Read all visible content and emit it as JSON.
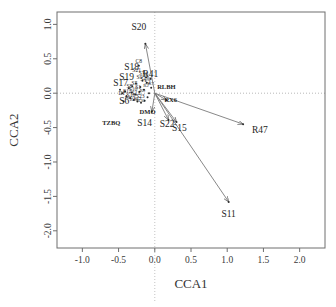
{
  "chart_data": {
    "type": "scatter",
    "title": "",
    "xlabel": "CCA1",
    "ylabel": "CCA2",
    "xlim": [
      -1.35,
      2.35
    ],
    "ylim": [
      -2.25,
      1.18
    ],
    "xticks": [
      -1.0,
      -0.5,
      0.0,
      0.5,
      1.0,
      1.5,
      2.0
    ],
    "xticklabels": [
      "-1.0",
      "-0.5",
      "0.0",
      "0.5",
      "1.0",
      "1.5",
      "2.0"
    ],
    "yticks": [
      1.0,
      0.5,
      0.0,
      -0.5,
      -1.0,
      -1.5,
      -2.0
    ],
    "yticklabels": [
      "1.0",
      "0.5",
      "0.0",
      "-0.5",
      "-1.0",
      "-1.5",
      "-2.0"
    ],
    "grid": false,
    "zero_lines": true,
    "legend": "none",
    "arrows": [
      {
        "label": "S20",
        "x": -0.13,
        "y": 0.72,
        "label_x": -0.22,
        "label_y": 0.92,
        "size": "big"
      },
      {
        "label": "R47",
        "x": 1.22,
        "y": -0.45,
        "label_x": 1.45,
        "label_y": -0.58,
        "size": "big"
      },
      {
        "label": "S11",
        "x": 1.02,
        "y": -1.58,
        "label_x": 1.02,
        "label_y": -1.8,
        "size": "big"
      },
      {
        "label": "S15",
        "x": 0.3,
        "y": -0.42,
        "label_x": 0.34,
        "label_y": -0.55,
        "size": "big"
      },
      {
        "label": "S22",
        "x": 0.19,
        "y": -0.39,
        "label_x": 0.17,
        "label_y": -0.49,
        "size": "big"
      },
      {
        "label": "RX6",
        "x": 0.16,
        "y": -0.1,
        "label_x": 0.22,
        "label_y": -0.13,
        "size": "bold"
      },
      {
        "label": "DMO",
        "x": -0.04,
        "y": -0.27,
        "label_x": -0.1,
        "label_y": -0.3,
        "size": "bold"
      }
    ],
    "points": [
      {
        "label": "RLBH",
        "x": 0.16,
        "y": 0.06,
        "size": "bold"
      },
      {
        "label": "TZBQ",
        "x": -0.6,
        "y": -0.46,
        "size": "bold"
      },
      {
        "label": "S14",
        "x": -0.14,
        "y": -0.47,
        "size": "big"
      },
      {
        "label": "S18",
        "x": -0.32,
        "y": 0.33,
        "size": "big"
      },
      {
        "label": "S19",
        "x": -0.39,
        "y": 0.19,
        "size": "big"
      },
      {
        "label": "S17",
        "x": -0.47,
        "y": 0.1,
        "size": "big"
      },
      {
        "label": "S6",
        "x": -0.42,
        "y": -0.15,
        "size": "big"
      },
      {
        "label": "C8",
        "x": -0.22,
        "y": 0.44,
        "size": "tiny"
      },
      {
        "label": "R41",
        "x": -0.06,
        "y": 0.23,
        "size": "big"
      },
      {
        "label": "S21",
        "x": -0.25,
        "y": 0.31,
        "size": "tiny"
      },
      {
        "label": "S7",
        "x": -0.18,
        "y": 0.27,
        "size": "tiny"
      },
      {
        "label": "S3",
        "x": -0.13,
        "y": 0.25,
        "size": "tiny"
      },
      {
        "label": "S9",
        "x": -0.21,
        "y": 0.2,
        "size": "tiny"
      },
      {
        "label": "S4",
        "x": -0.16,
        "y": 0.17,
        "size": "tiny"
      },
      {
        "label": "S2",
        "x": -0.1,
        "y": 0.14,
        "size": "tiny"
      },
      {
        "label": "S5",
        "x": -0.28,
        "y": 0.12,
        "size": "tiny"
      },
      {
        "label": "S8",
        "x": -0.35,
        "y": 0.08,
        "size": "tiny"
      },
      {
        "label": "S1",
        "x": -0.23,
        "y": 0.06,
        "size": "tiny"
      },
      {
        "label": "S10",
        "x": -0.3,
        "y": 0.03,
        "size": "tiny"
      },
      {
        "label": "S12",
        "x": -0.38,
        "y": 0.0,
        "size": "tiny"
      },
      {
        "label": "S13",
        "x": -0.26,
        "y": -0.02,
        "size": "tiny"
      },
      {
        "label": "S16",
        "x": -0.33,
        "y": -0.05,
        "size": "tiny"
      },
      {
        "label": "S23",
        "x": -0.2,
        "y": -0.07,
        "size": "tiny"
      },
      {
        "label": "DF",
        "x": -0.45,
        "y": -0.03,
        "size": "tiny"
      },
      {
        "label": "R2",
        "x": -0.12,
        "y": 0.09,
        "size": "micro"
      },
      {
        "label": "R5",
        "x": -0.08,
        "y": 0.19,
        "size": "micro"
      },
      {
        "label": "R7",
        "x": -0.05,
        "y": 0.12,
        "size": "micro"
      },
      {
        "label": "R9",
        "x": -0.17,
        "y": 0.02,
        "size": "micro"
      },
      {
        "label": "R12",
        "x": -0.24,
        "y": -0.1,
        "size": "micro"
      },
      {
        "label": "R18",
        "x": -0.29,
        "y": -0.12,
        "size": "micro"
      },
      {
        "label": "R23",
        "x": -0.36,
        "y": -0.09,
        "size": "micro"
      },
      {
        "label": "R30",
        "x": -0.19,
        "y": -0.13,
        "size": "micro"
      }
    ],
    "dots": [
      {
        "x": -0.13,
        "y": 0.72
      },
      {
        "x": 1.22,
        "y": -0.45
      },
      {
        "x": 1.02,
        "y": -1.58
      },
      {
        "x": 0.3,
        "y": -0.42
      },
      {
        "x": 0.19,
        "y": -0.39
      },
      {
        "x": 0.16,
        "y": -0.1
      },
      {
        "x": -0.04,
        "y": -0.27
      },
      {
        "x": -0.22,
        "y": 0.4
      },
      {
        "x": -0.06,
        "y": 0.21
      },
      {
        "x": -0.12,
        "y": 0.23
      },
      {
        "x": -0.17,
        "y": 0.18
      },
      {
        "x": -0.26,
        "y": 0.14
      },
      {
        "x": -0.31,
        "y": 0.1
      },
      {
        "x": -0.36,
        "y": 0.07
      },
      {
        "x": -0.41,
        "y": 0.03
      },
      {
        "x": -0.45,
        "y": 0.0
      },
      {
        "x": -0.39,
        "y": -0.04
      },
      {
        "x": -0.34,
        "y": -0.07
      },
      {
        "x": -0.29,
        "y": -0.1
      },
      {
        "x": -0.24,
        "y": -0.12
      },
      {
        "x": -0.19,
        "y": -0.14
      },
      {
        "x": -0.14,
        "y": -0.11
      },
      {
        "x": -0.1,
        "y": -0.06
      },
      {
        "x": -0.08,
        "y": 0.0
      },
      {
        "x": -0.15,
        "y": 0.05
      },
      {
        "x": -0.21,
        "y": 0.02
      },
      {
        "x": -0.27,
        "y": -0.02
      },
      {
        "x": -0.32,
        "y": 0.01
      },
      {
        "x": -0.2,
        "y": 0.09
      },
      {
        "x": -0.11,
        "y": 0.15
      },
      {
        "x": -0.05,
        "y": 0.08
      },
      {
        "x": -0.43,
        "y": -0.12
      },
      {
        "x": -0.48,
        "y": 0.05
      }
    ]
  }
}
